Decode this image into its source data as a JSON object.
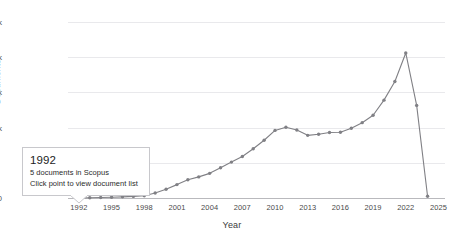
{
  "chart_data": {
    "type": "line",
    "title": "",
    "xlabel": "Year",
    "ylabel": "Documents",
    "xlim": [
      1991.0,
      2025.6
    ],
    "ylim": [
      0,
      25000
    ],
    "grid": true,
    "legend": "none",
    "x_ticks": [
      "1992",
      "1995",
      "1998",
      "2001",
      "2004",
      "2007",
      "2010",
      "2013",
      "2016",
      "2019",
      "2022",
      "2025"
    ],
    "y_ticks": [
      "0",
      "10k",
      "15k",
      "20k",
      "25k"
    ],
    "y_tick_values": [
      0,
      10000,
      15000,
      20000,
      25000
    ],
    "series": [
      {
        "name": "Documents in Scopus",
        "color": "#808085",
        "marker": "circle",
        "x": [
          1992,
          1993,
          1994,
          1995,
          1996,
          1997,
          1998,
          1999,
          2000,
          2001,
          2002,
          2003,
          2004,
          2005,
          2006,
          2007,
          2008,
          2009,
          2010,
          2011,
          2012,
          2013,
          2014,
          2015,
          2016,
          2017,
          2018,
          2019,
          2020,
          2021,
          2022,
          2023,
          2024
        ],
        "values": [
          5,
          40,
          70,
          110,
          160,
          230,
          330,
          700,
          1250,
          1900,
          2600,
          3000,
          3500,
          4300,
          5100,
          5900,
          7000,
          8200,
          9600,
          10050,
          9650,
          8900,
          9050,
          9300,
          9350,
          9900,
          10700,
          11750,
          13900,
          16550,
          20600,
          13150,
          250
        ]
      }
    ]
  },
  "tooltip": {
    "title": "1992",
    "line1": "5 documents in Scopus",
    "line2": "Click point to view document list",
    "anchor_year": 1992,
    "anchor_value": 5
  }
}
